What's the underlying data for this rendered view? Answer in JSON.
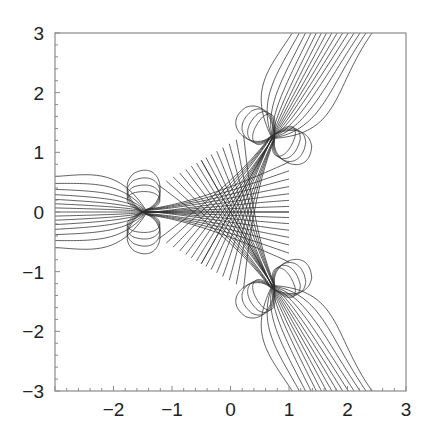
{
  "chart_data": {
    "type": "line",
    "title": "",
    "xlabel": "",
    "ylabel": "",
    "xlim": [
      -3,
      3
    ],
    "ylim": [
      -3,
      3
    ],
    "grid": false,
    "legend": null,
    "x_ticks": [
      {
        "value": -2,
        "label": "−2"
      },
      {
        "value": -1,
        "label": "−1"
      },
      {
        "value": 0,
        "label": "0"
      },
      {
        "value": 1,
        "label": "1"
      },
      {
        "value": 2,
        "label": "2"
      },
      {
        "value": 3,
        "label": "3"
      }
    ],
    "y_ticks": [
      {
        "value": 3,
        "label": "3"
      },
      {
        "value": 2,
        "label": "2"
      },
      {
        "value": 1,
        "label": "1"
      },
      {
        "value": 0,
        "label": "0"
      },
      {
        "value": -1,
        "label": "−1"
      },
      {
        "value": -2,
        "label": "−2"
      },
      {
        "value": -3,
        "label": "−3"
      }
    ],
    "minor_tick_step": 0.2,
    "symmetry": {
      "arms_deg": [
        180,
        60,
        -60
      ],
      "cusp_radius": 1.5,
      "cusp_points": [
        [
          -1.5,
          0.0
        ],
        [
          0.75,
          1.3
        ],
        [
          0.75,
          -1.3
        ]
      ],
      "arm_halfwidth_at_frame": 0.45,
      "inner_reach": 1.0,
      "inner_spread": 0.62,
      "curves_per_arm": 15
    },
    "arm_edge_crossings": {
      "left_edge_x=-3_y_range": [
        -0.45,
        0.45
      ],
      "top_edge_y=3_x_range": [
        1.2,
        2.15
      ],
      "bottom_edge_y=-3_x_range": [
        1.2,
        2.15
      ]
    }
  },
  "style": {
    "line_color": "#2e2e2e",
    "axis_color": "#8a8a8a",
    "label_color": "#222222",
    "background": "#ffffff"
  }
}
